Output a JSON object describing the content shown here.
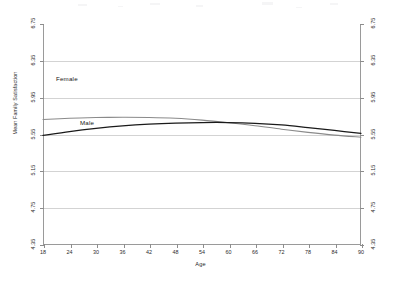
{
  "chart_data": {
    "type": "line",
    "title": "",
    "xlabel": "Age",
    "ylabel": "Mean Family Satisfaction",
    "xlim": [
      18,
      90
    ],
    "ylim": [
      4.35,
      6.75
    ],
    "xticks": [
      18,
      24,
      30,
      36,
      42,
      48,
      54,
      60,
      66,
      72,
      78,
      84,
      90
    ],
    "yticks": [
      4.35,
      4.75,
      5.15,
      5.55,
      5.95,
      6.35,
      6.75
    ],
    "xtick_labels": [
      "18",
      "24",
      "30",
      "36",
      "42",
      "48",
      "54",
      "60",
      "66",
      "72",
      "78",
      "84",
      "90"
    ],
    "ytick_labels": [
      "4.35",
      "4.75",
      "5.15",
      "5.55",
      "5.95",
      "6.35",
      "6.75"
    ],
    "grid": true,
    "grid_axis": "y",
    "dual_y_axis": true,
    "legend_position": "inline-annotation",
    "x": [
      18,
      24,
      30,
      36,
      42,
      48,
      54,
      60,
      66,
      72,
      78,
      84,
      90
    ],
    "series": [
      {
        "name": "Female",
        "color": "#8a8a8a",
        "annotation": "Female",
        "values": [
          5.713,
          5.726,
          5.734,
          5.737,
          5.735,
          5.726,
          5.706,
          5.678,
          5.646,
          5.608,
          5.573,
          5.543,
          5.521
        ]
      },
      {
        "name": "Male",
        "color": "#1a1a1a",
        "annotation": "Male",
        "values": [
          5.54,
          5.582,
          5.616,
          5.643,
          5.662,
          5.674,
          5.68,
          5.68,
          5.672,
          5.654,
          5.625,
          5.594,
          5.563
        ]
      }
    ]
  },
  "axes": {
    "left_title": "Mean Family Satisfaction",
    "bottom_title": "Age"
  },
  "annotations": {
    "female": "Female",
    "male": "Male"
  }
}
